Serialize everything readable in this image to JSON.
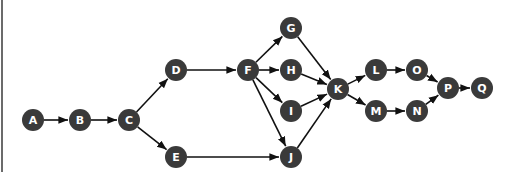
{
  "diagram": {
    "type": "directed-graph",
    "colors": {
      "node_fill": "#3a3a3a",
      "node_text": "#ffffff",
      "edge": "#111111",
      "background": "#ffffff"
    },
    "node_radius": 11,
    "nodes": [
      {
        "id": "A",
        "label": "A",
        "x": 33,
        "y": 120
      },
      {
        "id": "B",
        "label": "B",
        "x": 80,
        "y": 120
      },
      {
        "id": "C",
        "label": "C",
        "x": 129,
        "y": 120
      },
      {
        "id": "D",
        "label": "D",
        "x": 176,
        "y": 70
      },
      {
        "id": "E",
        "label": "E",
        "x": 176,
        "y": 157
      },
      {
        "id": "F",
        "label": "F",
        "x": 248,
        "y": 70
      },
      {
        "id": "G",
        "label": "G",
        "x": 291,
        "y": 28
      },
      {
        "id": "H",
        "label": "H",
        "x": 291,
        "y": 70
      },
      {
        "id": "I",
        "label": "I",
        "x": 291,
        "y": 111
      },
      {
        "id": "J",
        "label": "J",
        "x": 291,
        "y": 157
      },
      {
        "id": "K",
        "label": "K",
        "x": 338,
        "y": 89
      },
      {
        "id": "L",
        "label": "L",
        "x": 376,
        "y": 70
      },
      {
        "id": "M",
        "label": "M",
        "x": 376,
        "y": 111
      },
      {
        "id": "O",
        "label": "O",
        "x": 417,
        "y": 70
      },
      {
        "id": "N",
        "label": "N",
        "x": 417,
        "y": 111
      },
      {
        "id": "P",
        "label": "P",
        "x": 448,
        "y": 88
      },
      {
        "id": "Q",
        "label": "Q",
        "x": 482,
        "y": 88
      }
    ],
    "edges": [
      [
        "A",
        "B"
      ],
      [
        "B",
        "C"
      ],
      [
        "C",
        "D"
      ],
      [
        "C",
        "E"
      ],
      [
        "D",
        "F"
      ],
      [
        "E",
        "J"
      ],
      [
        "F",
        "G"
      ],
      [
        "F",
        "H"
      ],
      [
        "F",
        "I"
      ],
      [
        "F",
        "J"
      ],
      [
        "G",
        "K"
      ],
      [
        "H",
        "K"
      ],
      [
        "I",
        "K"
      ],
      [
        "J",
        "K"
      ],
      [
        "K",
        "L"
      ],
      [
        "K",
        "M"
      ],
      [
        "L",
        "O"
      ],
      [
        "M",
        "N"
      ],
      [
        "O",
        "P"
      ],
      [
        "N",
        "P"
      ],
      [
        "P",
        "Q"
      ]
    ]
  }
}
